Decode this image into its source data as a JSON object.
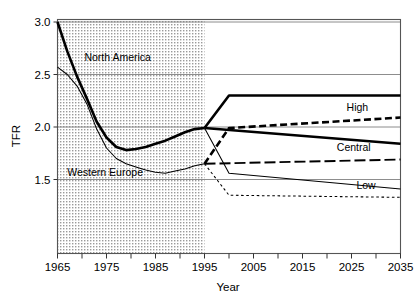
{
  "chart_data": {
    "type": "line",
    "title": "",
    "xlabel": "Year",
    "ylabel": "TFR",
    "xlim": [
      1965,
      2035
    ],
    "ylim": [
      1.25,
      3.0
    ],
    "grid": true,
    "legend_position": "inline-right",
    "xticks": [
      "1965",
      "1975",
      "1985",
      "1995",
      "2005",
      "2015",
      "2025",
      "2035"
    ],
    "xtick_values": [
      1965,
      1975,
      1985,
      1995,
      2005,
      2015,
      2025,
      2035
    ],
    "xminor_values": [
      1970,
      1980,
      1990,
      2000,
      2010,
      2020,
      2030
    ],
    "yticks": [
      "3.0",
      "2.5",
      "2.0",
      "1.5"
    ],
    "ytick_values": [
      3.0,
      2.5,
      2.0,
      1.5
    ],
    "shaded_region": {
      "label": "observed",
      "x_start": 1965,
      "x_end": 1995
    },
    "annotations": [
      {
        "text": "North America",
        "x": 1970.5,
        "y": 2.63
      },
      {
        "text": "Western Europe",
        "x": 1967.0,
        "y": 1.535
      }
    ],
    "series_labels": [
      {
        "text": "High",
        "x": 2024.0,
        "y": 2.155
      },
      {
        "text": "Central",
        "x": 2022.0,
        "y": 1.775
      },
      {
        "text": "Low",
        "x": 2026.0,
        "y": 1.405
      }
    ],
    "series": [
      {
        "name": "North America observed",
        "region": "North America",
        "style": "solid",
        "width": "thick",
        "color": "#000000",
        "x": [
          1965,
          1967,
          1969,
          1971,
          1973,
          1975,
          1977,
          1979,
          1981,
          1983,
          1985,
          1987,
          1989,
          1991,
          1993,
          1995
        ],
        "y": [
          3.0,
          2.72,
          2.48,
          2.27,
          2.05,
          1.9,
          1.81,
          1.78,
          1.79,
          1.81,
          1.84,
          1.87,
          1.91,
          1.95,
          1.98,
          1.99
        ]
      },
      {
        "name": "Western Europe observed",
        "region": "Western Europe",
        "style": "solid",
        "width": "thin",
        "color": "#000000",
        "x": [
          1965,
          1967,
          1969,
          1971,
          1973,
          1975,
          1977,
          1979,
          1981,
          1983,
          1985,
          1987,
          1989,
          1991,
          1993,
          1995
        ],
        "y": [
          2.57,
          2.5,
          2.39,
          2.22,
          1.98,
          1.8,
          1.7,
          1.65,
          1.62,
          1.59,
          1.57,
          1.56,
          1.58,
          1.6,
          1.63,
          1.65
        ]
      },
      {
        "name": "North America High",
        "region": "North America",
        "variant": "High",
        "style": "solid",
        "width": "thick",
        "color": "#000000",
        "x": [
          1995,
          2000,
          2035
        ],
        "y": [
          1.99,
          2.3,
          2.3
        ]
      },
      {
        "name": "North America Central",
        "region": "North America",
        "variant": "Central",
        "style": "solid",
        "width": "thick",
        "color": "#000000",
        "x": [
          1995,
          2035
        ],
        "y": [
          1.99,
          1.84
        ]
      },
      {
        "name": "North America Low",
        "region": "North America",
        "variant": "Low",
        "style": "solid",
        "width": "thin",
        "color": "#000000",
        "x": [
          1995,
          2000,
          2035
        ],
        "y": [
          1.99,
          1.56,
          1.41
        ]
      },
      {
        "name": "Western Europe High",
        "region": "Western Europe",
        "variant": "High",
        "style": "dashed",
        "width": "thick",
        "color": "#000000",
        "x": [
          1995,
          2000,
          2035
        ],
        "y": [
          1.65,
          1.99,
          2.09
        ]
      },
      {
        "name": "Western Europe Central",
        "region": "Western Europe",
        "variant": "Central",
        "style": "dash-long",
        "width": "medium",
        "color": "#000000",
        "x": [
          1995,
          2035
        ],
        "y": [
          1.65,
          1.69
        ]
      },
      {
        "name": "Western Europe Low",
        "region": "Western Europe",
        "variant": "Low",
        "style": "dotted",
        "width": "thin",
        "color": "#000000",
        "x": [
          1995,
          2000,
          2035
        ],
        "y": [
          1.65,
          1.35,
          1.33
        ]
      }
    ]
  },
  "colors": {
    "line": "#000000",
    "grid": "#808080",
    "frame": "#555555",
    "shade_fg": "#8a8a8a",
    "shade_bg": "#e8e8e8",
    "background": "#ffffff"
  }
}
